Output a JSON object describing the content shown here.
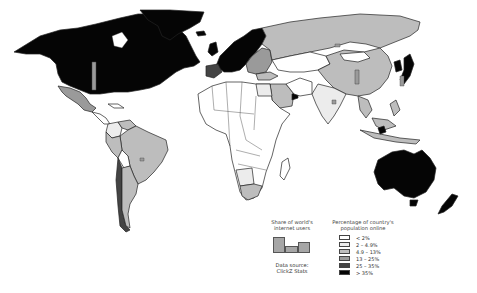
{
  "map": {
    "title": "World internet usage by country",
    "colors": {
      "lt2": "#ffffff",
      "2to4_9": "#ececec",
      "4_9to13": "#bdbdbd",
      "13to25": "#9a9a9a",
      "25to35": "#444444",
      "gt35": "#050505",
      "border": "#222222",
      "ocean": "#ffffff"
    },
    "regions": [
      {
        "name": "North America (USA & Canada)",
        "class": "> 35%"
      },
      {
        "name": "Greenland",
        "class": "> 35%"
      },
      {
        "name": "Mexico",
        "class": "13 – 25%"
      },
      {
        "name": "Central America & Caribbean",
        "class": "< 2%"
      },
      {
        "name": "Colombia",
        "class": "2 – 4.9%"
      },
      {
        "name": "Venezuela",
        "class": "4.9 – 13%"
      },
      {
        "name": "Brazil",
        "class": "4.9 – 13%"
      },
      {
        "name": "Peru",
        "class": "4.9 – 13%"
      },
      {
        "name": "Bolivia",
        "class": "< 2%"
      },
      {
        "name": "Argentina",
        "class": "4.9 – 13%"
      },
      {
        "name": "Chile",
        "class": "25 – 35%"
      },
      {
        "name": "Western Europe",
        "class": "> 35%"
      },
      {
        "name": "Spain",
        "class": "25 – 35%"
      },
      {
        "name": "Eastern Europe",
        "class": "13 – 25%"
      },
      {
        "name": "Russia",
        "class": "4.9 – 13%"
      },
      {
        "name": "Central Asia",
        "class": "< 2%"
      },
      {
        "name": "China",
        "class": "4.9 – 13%"
      },
      {
        "name": "India",
        "class": "2 – 4.9%"
      },
      {
        "name": "Japan",
        "class": "> 35%"
      },
      {
        "name": "South Korea",
        "class": "> 35%"
      },
      {
        "name": "Southeast Asia",
        "class": "4.9 – 13%"
      },
      {
        "name": "Saudi Arabia",
        "class": "4.9 – 13%"
      },
      {
        "name": "Egypt",
        "class": "2 – 4.9%"
      },
      {
        "name": "Africa (most)",
        "class": "< 2%"
      },
      {
        "name": "South Africa",
        "class": "4.9 – 13%"
      },
      {
        "name": "Namibia/Botswana",
        "class": "2 – 4.9%"
      },
      {
        "name": "Australia",
        "class": "> 35%"
      },
      {
        "name": "New Zealand",
        "class": "> 35%"
      }
    ]
  },
  "legend": {
    "share_title_line1": "Share of world's",
    "share_title_line2": "internet users",
    "share_bars": [
      {
        "height": 16,
        "x": 0,
        "width": 12
      },
      {
        "height": 7,
        "x": 12,
        "width": 13
      },
      {
        "height": 11,
        "x": 25,
        "width": 12
      }
    ],
    "source_line1": "Data source:",
    "source_line2": "ClickZ Stats",
    "pct_title_line1": "Percentage of country's",
    "pct_title_line2": "population online",
    "classes": [
      {
        "label": "< 2%",
        "color": "#ffffff"
      },
      {
        "label": "2 – 4.9%",
        "color": "#ececec"
      },
      {
        "label": "4.9 – 13%",
        "color": "#bdbdbd"
      },
      {
        "label": "13 – 25%",
        "color": "#9a9a9a"
      },
      {
        "label": "25 – 35%",
        "color": "#444444"
      },
      {
        "label": "> 35%",
        "color": "#050505"
      }
    ]
  }
}
